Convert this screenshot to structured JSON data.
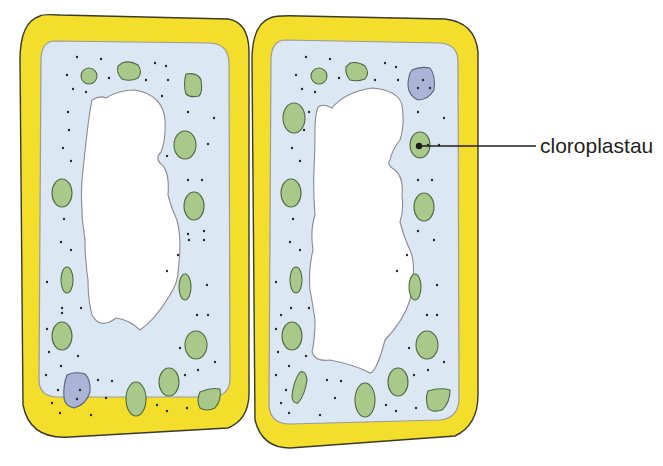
{
  "diagram": {
    "type": "plant-cells",
    "cell_count": 2,
    "labels": [
      {
        "text": "cloroplastau",
        "points_to": "chloroplast"
      }
    ]
  },
  "colors": {
    "cell_wall": "#f3de2c",
    "cell_wall_outline": "#3b3a2a",
    "cytoplasm": "#dbe7f2",
    "membrane": "#9a9aa0",
    "vacuole": "#ffffff",
    "chloroplast": "#a8c989",
    "chloroplast_outline": "#4f6b45",
    "nucleus": "#a9b4d6",
    "nucleus_outline": "#5a6078",
    "dot": "#2a2a2a",
    "leader_line": "#231f20"
  }
}
